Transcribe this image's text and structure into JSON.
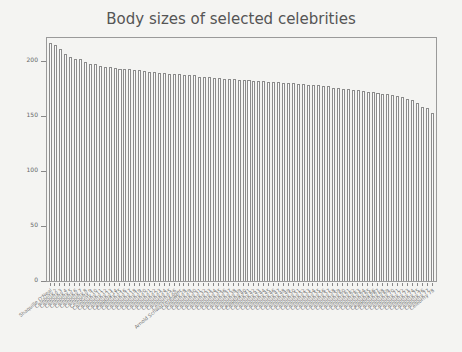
{
  "chart_data": {
    "type": "bar",
    "title": "Body sizes of selected celebrities",
    "xlabel": "",
    "ylabel": "",
    "ylim": [
      0,
      222
    ],
    "yticks": [
      0,
      50,
      100,
      150,
      200
    ],
    "grid": false,
    "legend": null,
    "categories": [
      "Shaquille O'Neal",
      "Celebrity 2",
      "Celebrity 3",
      "Celebrity 4",
      "Celebrity 5",
      "Celebrity 6",
      "Celebrity 7",
      "Celebrity 8",
      "Celebrity 9",
      "Celebrity 10",
      "Celebrity 11",
      "Celebrity 12",
      "Celebrity 13",
      "Celebrity 14",
      "Celebrity 15",
      "Celebrity 16",
      "Celebrity 17",
      "Celebrity 18",
      "Celebrity 19",
      "Celebrity 20",
      "Celebrity 21",
      "Celebrity 22",
      "Celebrity 23",
      "Celebrity 24",
      "Celebrity 25",
      "Celebrity 26",
      "Arnold Schwarzenegger",
      "Celebrity 28",
      "Celebrity 29",
      "Celebrity 30",
      "Celebrity 31",
      "Celebrity 32",
      "Celebrity 33",
      "Celebrity 34",
      "Celebrity 35",
      "Celebrity 36",
      "Celebrity 37",
      "Celebrity 38",
      "Celebrity 39",
      "Celebrity 40",
      "Celebrity 41",
      "Celebrity 42",
      "Celebrity 43",
      "Celebrity 44",
      "Celebrity 45",
      "Celebrity 46",
      "Celebrity 47",
      "Celebrity 48",
      "Celebrity 49",
      "Celebrity 50",
      "Celebrity 51",
      "Celebrity 52",
      "Celebrity 53",
      "Celebrity 54",
      "Celebrity 55",
      "Celebrity 56",
      "Celebrity 57",
      "Celebrity 58",
      "Celebrity 59",
      "Celebrity 60",
      "Celebrity 61",
      "Celebrity 62",
      "Celebrity 63",
      "Celebrity 64",
      "Celebrity 65",
      "Celebrity 66",
      "Celebrity 67",
      "Celebrity 68",
      "Celebrity 69",
      "Celebrity 70",
      "Celebrity 71",
      "Celebrity 72",
      "Celebrity 73",
      "Celebrity 74",
      "Celebrity 75",
      "Celebrity 76",
      "Celebrity 77",
      "Celebrity 78"
    ],
    "values": [
      217,
      215,
      211,
      207,
      204,
      202,
      202,
      199,
      197,
      197,
      196,
      195,
      195,
      194,
      193,
      193,
      193,
      192,
      192,
      191,
      190,
      190,
      189,
      189,
      188,
      188,
      188,
      187,
      187,
      187,
      186,
      186,
      186,
      185,
      185,
      184,
      184,
      184,
      183,
      183,
      183,
      182,
      182,
      182,
      181,
      181,
      181,
      180,
      180,
      180,
      179,
      179,
      178,
      178,
      178,
      177,
      177,
      176,
      176,
      175,
      175,
      174,
      174,
      173,
      172,
      172,
      171,
      170,
      170,
      169,
      168,
      167,
      166,
      165,
      162,
      158,
      157,
      153
    ],
    "style": {
      "bar_fill": "#fbfbfb",
      "bar_stroke": "#8c8c8c",
      "axis_color": "#9a9a9a",
      "background": "#f4f4f2"
    }
  }
}
